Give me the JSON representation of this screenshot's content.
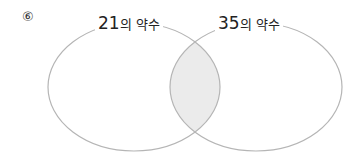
{
  "problem": {
    "number": "⑥"
  },
  "venn": {
    "set_a": {
      "number": "21",
      "suffix": "의 약수"
    },
    "set_b": {
      "number": "35",
      "suffix": "의 약수"
    },
    "intersection_fill": "#ebebeb",
    "stroke": "#b5b5b5"
  }
}
